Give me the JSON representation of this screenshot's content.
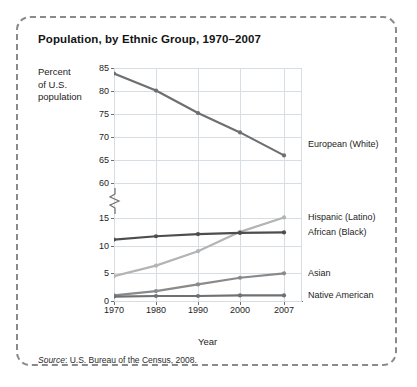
{
  "figure": {
    "title": "Population, by Ethnic Group, 1970–2007",
    "source_prefix": "Source",
    "source_text": ": U.S. Bureau of the Census, 2008.",
    "border_color": "#8a8a8a",
    "grid_color": "#d6dde3",
    "axis_color": "#6f6f6f"
  },
  "chart_data": {
    "type": "line",
    "title": "Population, by Ethnic Group, 1970–2007",
    "xlabel": "Year",
    "ylabel": "Percent of U.S. population",
    "ylabel_lines": [
      "Percent",
      "of U.S.",
      "population"
    ],
    "x": [
      1970,
      1980,
      1990,
      2000,
      2007
    ],
    "xtick_labels": [
      "1970",
      "1980",
      "1990",
      "2000",
      "2007"
    ],
    "ytick_labels": [
      "85",
      "80",
      "75",
      "70",
      "65",
      "60",
      "15",
      "10",
      "5",
      "0"
    ],
    "ytick_values": [
      85,
      80,
      75,
      70,
      65,
      60,
      15,
      10,
      5,
      0
    ],
    "axis_break": {
      "present": true,
      "between": [
        60,
        15
      ],
      "symbol": "zigzag"
    },
    "grid": true,
    "legend_position": "right-inline",
    "series": [
      {
        "name": "European (White)",
        "values": [
          83.8,
          80.1,
          75.2,
          71.0,
          66.0
        ],
        "color": "#6f6f6f",
        "label_value": 68.5
      },
      {
        "name": "Hispanic (Latino)",
        "values": [
          4.5,
          6.4,
          9.0,
          12.5,
          15.1
        ],
        "color": "#b4b4b4",
        "label_value": 15.1
      },
      {
        "name": "African (Black)",
        "values": [
          11.1,
          11.7,
          12.1,
          12.3,
          12.4
        ],
        "color": "#4d4d4d",
        "label_value": 12.4
      },
      {
        "name": "Asian",
        "values": [
          1.0,
          1.8,
          3.0,
          4.2,
          5.0
        ],
        "color": "#8a8a8a",
        "label_value": 5.0
      },
      {
        "name": "Native American",
        "values": [
          0.8,
          0.9,
          0.9,
          1.0,
          1.0
        ],
        "color": "#707070",
        "label_value": 1.0
      }
    ]
  }
}
